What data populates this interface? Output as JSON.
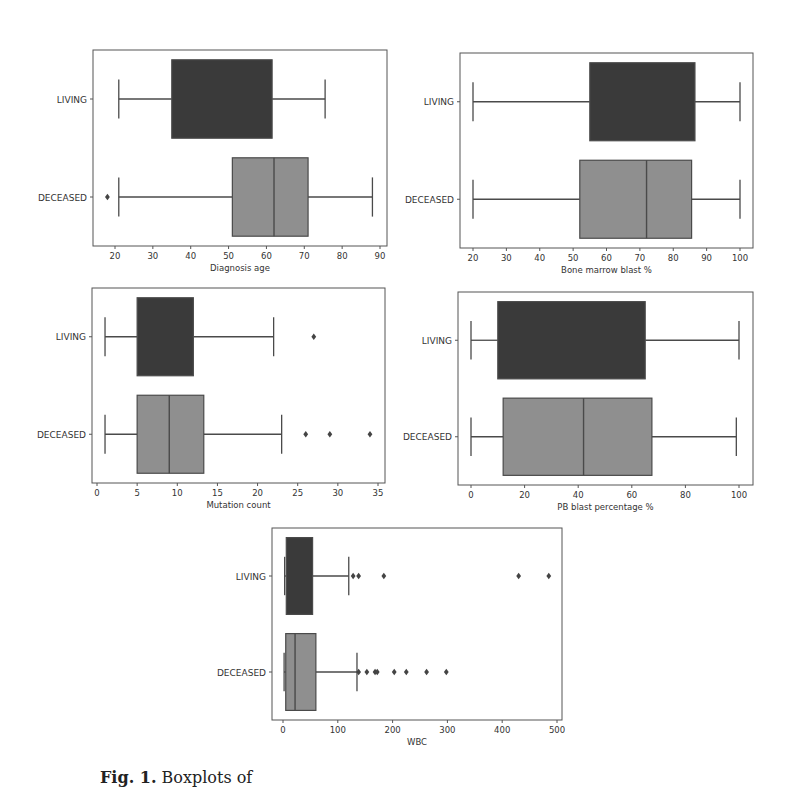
{
  "colors": {
    "living": "#3a3a3a",
    "deceased": "#8f8f8f",
    "line": "#4a4a4a",
    "frame": "#555555",
    "text": "#333333"
  },
  "categories_label": [
    "LIVING",
    "DECEASED"
  ],
  "caption": {
    "prefix": "Fig. 1.",
    "text": "Boxplots of"
  },
  "chart_data": [
    {
      "type": "boxplot",
      "orientation": "horizontal",
      "xlabel": "Diagnosis age",
      "ylabel": "",
      "categories": [
        "LIVING",
        "DECEASED"
      ],
      "xlim": [
        15,
        92
      ],
      "xticks": [
        20,
        30,
        40,
        50,
        60,
        70,
        80,
        90
      ],
      "frame": {
        "x0": 93,
        "x1": 387,
        "y0": 50,
        "y1": 246
      },
      "tick_px": {
        "v0": 20,
        "p0": 115,
        "v1": 90,
        "p1": 380
      },
      "series": [
        {
          "name": "LIVING",
          "whisker_low": 21,
          "q1": 35,
          "median": null,
          "q3": 61.5,
          "whisker_high": 75.5,
          "outliers": []
        },
        {
          "name": "DECEASED",
          "whisker_low": 21,
          "q1": 51,
          "median": 62,
          "q3": 71,
          "whisker_high": 88,
          "outliers": [
            18
          ]
        }
      ]
    },
    {
      "type": "boxplot",
      "orientation": "horizontal",
      "xlabel": "Bone marrow blast %",
      "ylabel": "",
      "categories": [
        "LIVING",
        "DECEASED"
      ],
      "xlim": [
        16,
        104
      ],
      "xticks": [
        20,
        30,
        40,
        50,
        60,
        70,
        80,
        90,
        100
      ],
      "frame": {
        "x0": 460,
        "x1": 753,
        "y0": 53,
        "y1": 248
      },
      "tick_px": {
        "v0": 20,
        "p0": 473,
        "v1": 100,
        "p1": 740
      },
      "series": [
        {
          "name": "LIVING",
          "whisker_low": 20,
          "q1": 55,
          "median": null,
          "q3": 86.5,
          "whisker_high": 100,
          "outliers": []
        },
        {
          "name": "DECEASED",
          "whisker_low": 20,
          "q1": 52,
          "median": 72,
          "q3": 85.5,
          "whisker_high": 100,
          "outliers": []
        }
      ]
    },
    {
      "type": "boxplot",
      "orientation": "horizontal",
      "xlabel": "Mutation count",
      "ylabel": "",
      "categories": [
        "LIVING",
        "DECEASED"
      ],
      "xlim": [
        -0.6,
        35.8
      ],
      "xticks": [
        0,
        5,
        10,
        15,
        20,
        25,
        30,
        35
      ],
      "frame": {
        "x0": 92,
        "x1": 385,
        "y0": 288,
        "y1": 483
      },
      "tick_px": {
        "v0": 0,
        "p0": 97,
        "v1": 35,
        "p1": 378
      },
      "series": [
        {
          "name": "LIVING",
          "whisker_low": 1,
          "q1": 5,
          "median": null,
          "q3": 12,
          "whisker_high": 22,
          "outliers": [
            27
          ]
        },
        {
          "name": "DECEASED",
          "whisker_low": 1,
          "q1": 5,
          "median": 9,
          "q3": 13.3,
          "whisker_high": 23,
          "outliers": [
            26,
            29,
            34
          ]
        }
      ]
    },
    {
      "type": "boxplot",
      "orientation": "horizontal",
      "xlabel": "PB blast percentage %",
      "ylabel": "",
      "categories": [
        "LIVING",
        "DECEASED"
      ],
      "xlim": [
        -5,
        105
      ],
      "xticks": [
        0,
        20,
        40,
        60,
        80,
        100
      ],
      "frame": {
        "x0": 458,
        "x1": 753,
        "y0": 292,
        "y1": 485
      },
      "tick_px": {
        "v0": 0,
        "p0": 471,
        "v1": 100,
        "p1": 739
      },
      "series": [
        {
          "name": "LIVING",
          "whisker_low": 0,
          "q1": 10,
          "median": null,
          "q3": 65,
          "whisker_high": 100,
          "outliers": []
        },
        {
          "name": "DECEASED",
          "whisker_low": 0,
          "q1": 12,
          "median": 42,
          "q3": 67.5,
          "whisker_high": 99,
          "outliers": []
        }
      ]
    },
    {
      "type": "boxplot",
      "orientation": "horizontal",
      "xlabel": "WBC",
      "ylabel": "",
      "categories": [
        "LIVING",
        "DECEASED"
      ],
      "xlim": [
        -20,
        510
      ],
      "xticks": [
        0,
        100,
        200,
        300,
        400,
        500
      ],
      "frame": {
        "x0": 272,
        "x1": 562,
        "y0": 528,
        "y1": 720
      },
      "tick_px": {
        "v0": 0,
        "p0": 283,
        "v1": 500,
        "p1": 557
      },
      "series": [
        {
          "name": "LIVING",
          "whisker_low": 3,
          "q1": 6,
          "median": null,
          "q3": 54,
          "whisker_high": 120,
          "outliers": [
            128,
            138,
            184,
            430,
            485
          ]
        },
        {
          "name": "DECEASED",
          "whisker_low": 2,
          "q1": 5,
          "median": 22,
          "q3": 60,
          "whisker_high": 135,
          "outliers": [
            138,
            153,
            168,
            172,
            203,
            225,
            262,
            298
          ]
        }
      ]
    }
  ]
}
